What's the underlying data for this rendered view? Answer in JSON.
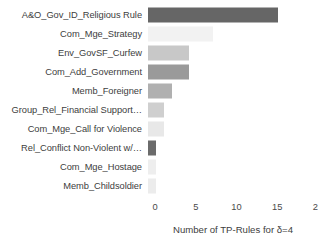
{
  "chart_data": {
    "type": "bar",
    "orientation": "horizontal",
    "title": "",
    "xlabel": "Number of TP-Rules for δ=4",
    "ylabel": "",
    "xlim": [
      0,
      20
    ],
    "xticks": [
      0,
      5,
      10,
      15,
      20
    ],
    "xtick_labels": [
      "0",
      "5",
      "10",
      "15",
      "20"
    ],
    "grid": false,
    "legend": null,
    "categories": [
      "A&O_Gov_ID_Religious Rule",
      "Com_Mge_Strategy",
      "Env_GovSF_Curfew",
      "Com_Add_Government",
      "Memb_Foreigner",
      "Group_Rel_Financial Support…",
      "Com_Mge_Call for Violence",
      "Rel_Conflict Non-Violent w/…",
      "Com_Mge_Hostage",
      "Memb_Childsoldier"
    ],
    "values": [
      16,
      8,
      5,
      5,
      3,
      2,
      2,
      1,
      1,
      1
    ],
    "bar_colors": [
      "#666666",
      "#f2f2f2",
      "#c8c8c8",
      "#9a9a9a",
      "#b0b0b0",
      "#cfcfcf",
      "#e8e8e8",
      "#6b6b6b",
      "#eeeeee",
      "#ececec"
    ]
  }
}
